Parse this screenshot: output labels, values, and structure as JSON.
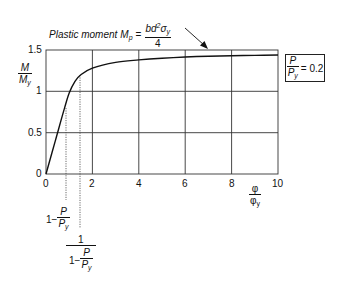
{
  "chart_data": {
    "type": "line",
    "title": "",
    "xlabel": "φ/φ_y",
    "ylabel": "M/M_y",
    "xlim": [
      0,
      10
    ],
    "ylim": [
      0,
      1.5
    ],
    "x_ticks": [
      "0",
      "2",
      "4",
      "6",
      "8",
      "10"
    ],
    "y_ticks": [
      "0",
      "0.5",
      "1",
      "1.5"
    ],
    "grid": true,
    "series": [
      {
        "name": "P/P_y = 0.2",
        "x": [
          0,
          0.4,
          0.8,
          1.0,
          1.25,
          1.5,
          2,
          3,
          4,
          5,
          6,
          7,
          8,
          9,
          10
        ],
        "values": [
          0,
          0.4,
          0.8,
          0.98,
          1.12,
          1.2,
          1.28,
          1.35,
          1.38,
          1.4,
          1.415,
          1.425,
          1.43,
          1.435,
          1.44
        ]
      }
    ],
    "reference_lines": [
      {
        "x": 0.8,
        "style": "dotted",
        "label": "1 − P/P_y"
      },
      {
        "x": 1.25,
        "style": "dotted",
        "label": "1 / (1 − P/P_y)"
      }
    ],
    "annotations": [
      {
        "text": "Plastic moment M_p = b d² σ_y / 4",
        "arrow_to_y": 1.5
      },
      {
        "text": "P/P_y = 0.2",
        "boxed": true,
        "position": "right"
      }
    ]
  },
  "labels": {
    "y_axis_num": "M",
    "y_axis_den": "M",
    "y_axis_den_sub": "y",
    "x_axis_num": "φ",
    "x_axis_den": "φ",
    "x_axis_den_sub": "y",
    "yticks": [
      "1.5",
      "1",
      "0.5",
      "0"
    ],
    "xticks": [
      "0",
      "2",
      "4",
      "6",
      "8",
      "10"
    ],
    "plastic_text": "Plastic moment",
    "plastic_M": "M",
    "plastic_sub": "p",
    "equals": "=",
    "plastic_num_a": "bd",
    "plastic_num_sup": "2",
    "plastic_num_b": "σ",
    "plastic_num_sub": "y",
    "plastic_den": "4",
    "box_num": "P",
    "box_den": "P",
    "box_den_sub": "y",
    "box_value": "= 0.2",
    "ref1_prefix": "1−",
    "ref1_num": "P",
    "ref1_den": "P",
    "ref1_den_sub": "y",
    "ref2_num": "1",
    "ref2_den_prefix": "1−",
    "ref2_den_num": "P",
    "ref2_den_den": "P",
    "ref2_den_den_sub": "y"
  }
}
